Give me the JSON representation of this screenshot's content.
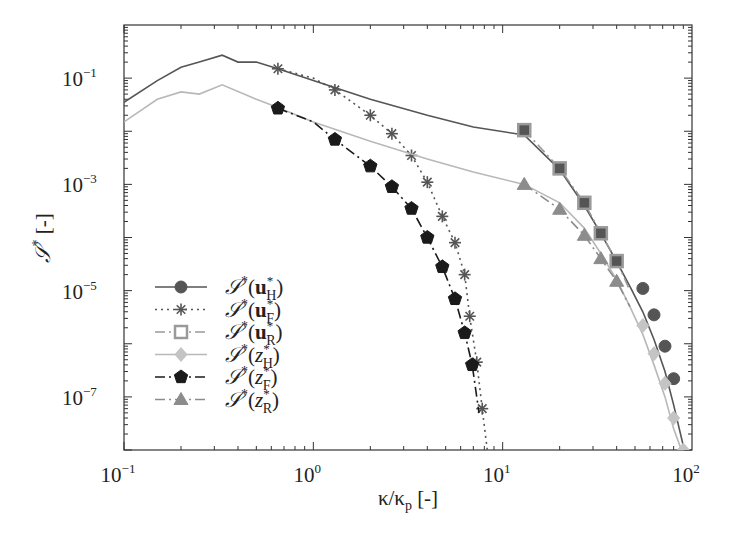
{
  "chart_data": {
    "type": "line",
    "title": "",
    "xlabel": "κ/κp [-]",
    "ylabel": "𝒮* [-]",
    "xscale": "log",
    "yscale": "log",
    "xlim": [
      0.1,
      100
    ],
    "ylim": [
      1e-08,
      1.0
    ],
    "grid": false,
    "legend_position": "lower left",
    "x_ticks": [
      {
        "base": "10",
        "exp": "−1",
        "value": 0.1
      },
      {
        "base": "10",
        "exp": "0",
        "value": 1
      },
      {
        "base": "10",
        "exp": "1",
        "value": 10
      },
      {
        "base": "10",
        "exp": "2",
        "value": 100
      }
    ],
    "y_ticks": [
      {
        "base": "10",
        "exp": "−1",
        "value": 0.1
      },
      {
        "base": "10",
        "exp": "−3",
        "value": 0.001
      },
      {
        "base": "10",
        "exp": "−5",
        "value": 1e-05
      },
      {
        "base": "10",
        "exp": "−7",
        "value": 1e-07
      }
    ],
    "series": [
      {
        "name": "𝒮*(u*H)",
        "label_main": "𝒮*(",
        "label_sym": "u",
        "label_bold": true,
        "label_sub": "H",
        "label_sup": "*",
        "line": "solid",
        "marker": "circle",
        "color": "#555555",
        "marker_color": "#555555",
        "marker_fill": "#555555",
        "x": [
          0.1,
          0.15,
          0.2,
          0.25,
          0.33,
          0.4,
          0.5,
          0.65,
          1.0,
          2.0,
          4.0,
          7.0,
          13.0,
          20.0,
          27.0,
          33.0,
          40.0,
          47.0,
          55.0,
          63.0,
          72.0,
          80.0,
          90.0
        ],
        "y": [
          0.035,
          0.09,
          0.16,
          0.2,
          0.27,
          0.2,
          0.2,
          0.15,
          0.09,
          0.04,
          0.02,
          0.012,
          0.0085,
          0.0019,
          0.0004,
          0.00012,
          3.5e-05,
          1.2e-05,
          4e-06,
          1.2e-06,
          3e-07,
          7e-08,
          1.2e-08
        ],
        "marker_x": [
          55.0,
          63.0,
          72.0,
          80.0
        ],
        "marker_y": [
          1.1e-05,
          3.5e-06,
          9e-07,
          2.2e-07
        ]
      },
      {
        "name": "𝒮*(u*F)",
        "label_main": "𝒮*(",
        "label_sym": "u",
        "label_bold": true,
        "label_sub": "F",
        "label_sup": "*",
        "line": "dotted",
        "marker": "star",
        "color": "#555555",
        "marker_color": "#555555",
        "marker_fill": "none",
        "x": [
          0.65,
          1.0,
          1.3,
          2.0,
          2.6,
          3.3,
          4.0,
          4.8,
          5.6,
          6.3,
          6.7,
          7.3,
          7.8,
          8.3
        ],
        "y": [
          0.15,
          0.1,
          0.06,
          0.02,
          0.009,
          0.0035,
          0.0011,
          0.00025,
          8e-05,
          2e-05,
          3.3e-06,
          4.5e-07,
          6e-08,
          1e-08
        ],
        "marker_x": [
          0.65,
          1.3,
          2.0,
          2.6,
          3.3,
          4.0,
          4.8,
          5.6,
          6.3,
          6.7,
          7.3,
          7.8
        ],
        "marker_y": [
          0.15,
          0.06,
          0.02,
          0.009,
          0.0035,
          0.0011,
          0.00025,
          8e-05,
          2e-05,
          3.3e-06,
          4.5e-07,
          6e-08
        ]
      },
      {
        "name": "𝒮*(u*R)",
        "label_main": "𝒮*(",
        "label_sym": "u",
        "label_bold": true,
        "label_sub": "R",
        "label_sup": "*",
        "line": "dashdot",
        "marker": "square",
        "color": "#9a9a9a",
        "marker_color": "#9a9a9a",
        "marker_fill": "#555555",
        "x": [
          13.0,
          20.0,
          27.0,
          33.0,
          40.0,
          47.0
        ],
        "y": [
          0.0105,
          0.002,
          0.00045,
          0.00012,
          3.6e-05,
          1e-05
        ],
        "marker_x": [
          13.0,
          20.0,
          27.0,
          33.0,
          40.0
        ],
        "marker_y": [
          0.0105,
          0.002,
          0.00045,
          0.00012,
          3.6e-05
        ]
      },
      {
        "name": "𝒮*(z*H)",
        "label_main": "𝒮*(",
        "label_sym": "z",
        "label_bold": false,
        "label_sub": "H",
        "label_sup": "*",
        "line": "solid",
        "marker": "diamond",
        "color": "#b8b8b8",
        "marker_color": "#c4c4c4",
        "marker_fill": "#c4c4c4",
        "x": [
          0.1,
          0.15,
          0.2,
          0.25,
          0.33,
          0.5,
          0.65,
          1.0,
          2.0,
          4.0,
          7.0,
          13.0,
          20.0,
          27.0,
          33.0,
          40.0,
          47.0,
          55.0,
          63.0,
          72.0,
          80.0,
          90.0
        ],
        "y": [
          0.015,
          0.04,
          0.055,
          0.05,
          0.075,
          0.04,
          0.028,
          0.015,
          0.0065,
          0.003,
          0.0017,
          0.001,
          0.00045,
          0.00015,
          5e-05,
          1.6e-05,
          5e-06,
          1.5e-06,
          4e-07,
          1e-07,
          2.5e-08,
          8e-09
        ],
        "marker_x": [
          55.0,
          63.0,
          72.0,
          80.0,
          90.0
        ],
        "marker_y": [
          2.2e-06,
          6.5e-07,
          1.8e-07,
          4e-08,
          1e-08
        ]
      },
      {
        "name": "𝒮*(z*F)",
        "label_main": "𝒮*(",
        "label_sym": "z",
        "label_bold": false,
        "label_sub": "F",
        "label_sup": "*",
        "line": "dashdot",
        "marker": "pentagon",
        "color": "#1a1a1a",
        "marker_color": "#1a1a1a",
        "marker_fill": "#1a1a1a",
        "x": [
          0.65,
          1.0,
          1.3,
          2.0,
          2.6,
          3.3,
          4.0,
          4.8,
          5.6,
          6.3,
          6.9,
          7.5
        ],
        "y": [
          0.027,
          0.015,
          0.007,
          0.0022,
          0.0009,
          0.00035,
          0.0001,
          2.8e-05,
          7e-06,
          1.6e-06,
          4e-07,
          5e-08
        ],
        "marker_x": [
          0.65,
          1.3,
          2.0,
          2.6,
          3.3,
          4.0,
          4.8,
          5.6,
          6.3,
          6.9
        ],
        "marker_y": [
          0.027,
          0.007,
          0.0022,
          0.0009,
          0.00035,
          0.0001,
          2.8e-05,
          7e-06,
          1.6e-06,
          4e-07
        ]
      },
      {
        "name": "𝒮*(z*R)",
        "label_main": "𝒮*(",
        "label_sym": "z",
        "label_bold": false,
        "label_sub": "R",
        "label_sup": "*",
        "line": "dashdot",
        "marker": "triangle",
        "color": "#8c8c8c",
        "marker_color": "#8c8c8c",
        "marker_fill": "#8c8c8c",
        "x": [
          13.0,
          20.0,
          27.0,
          33.0,
          40.0,
          47.0
        ],
        "y": [
          0.001,
          0.00034,
          0.00011,
          4e-05,
          1.5e-05,
          5e-06
        ],
        "marker_x": [
          13.0,
          20.0,
          27.0,
          33.0,
          40.0
        ],
        "marker_y": [
          0.001,
          0.00034,
          0.00011,
          4e-05,
          1.5e-05
        ]
      }
    ]
  },
  "labels": {
    "xlabel_kappa": "κ/κ",
    "xlabel_sub": "p",
    "xlabel_unit": " [-]",
    "ylabel_sym": "𝒮",
    "ylabel_sup": "*",
    "ylabel_unit": " [-]"
  }
}
